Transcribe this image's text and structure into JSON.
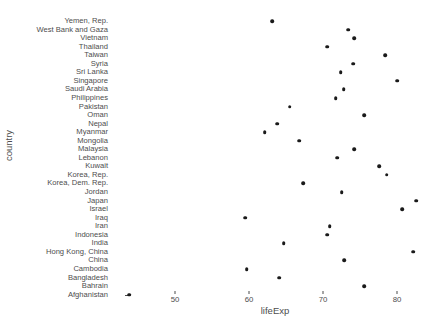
{
  "chart_data": {
    "type": "scatter",
    "title": "",
    "xlabel": "lifeExp",
    "ylabel": "country",
    "xlim": [
      42,
      86
    ],
    "xticks": [
      50,
      60,
      70,
      80
    ],
    "xticklabels": [
      "50",
      "60",
      "70",
      "80"
    ],
    "grid": false,
    "legend": null,
    "categories": [
      "Afghanistan",
      "Bahrain",
      "Bangladesh",
      "Cambodia",
      "China",
      "Hong Kong, China",
      "India",
      "Indonesia",
      "Iran",
      "Iraq",
      "Israel",
      "Japan",
      "Jordan",
      "Korea, Dem. Rep.",
      "Korea, Rep.",
      "Kuwait",
      "Lebanon",
      "Malaysia",
      "Mongolia",
      "Myanmar",
      "Nepal",
      "Oman",
      "Pakistan",
      "Philippines",
      "Saudi Arabia",
      "Singapore",
      "Sri Lanka",
      "Syria",
      "Taiwan",
      "Thailand",
      "Vietnam",
      "West Bank and Gaza",
      "Yemen, Rep."
    ],
    "points": [
      {
        "country": "Yemen, Rep.",
        "lifeExp": 63.1
      },
      {
        "country": "West Bank and Gaza",
        "lifeExp": 73.4
      },
      {
        "country": "Vietnam",
        "lifeExp": 74.2
      },
      {
        "country": "Thailand",
        "lifeExp": 70.6
      },
      {
        "country": "Taiwan",
        "lifeExp": 78.4
      },
      {
        "country": "Syria",
        "lifeExp": 74.1
      },
      {
        "country": "Sri Lanka",
        "lifeExp": 72.4
      },
      {
        "country": "Singapore",
        "lifeExp": 80.0
      },
      {
        "country": "Saudi Arabia",
        "lifeExp": 72.8
      },
      {
        "country": "Philippines",
        "lifeExp": 71.7
      },
      {
        "country": "Pakistan",
        "lifeExp": 65.5
      },
      {
        "country": "Oman",
        "lifeExp": 75.6
      },
      {
        "country": "Nepal",
        "lifeExp": 63.8
      },
      {
        "country": "Myanmar",
        "lifeExp": 62.1
      },
      {
        "country": "Mongolia",
        "lifeExp": 66.8
      },
      {
        "country": "Malaysia",
        "lifeExp": 74.2
      },
      {
        "country": "Lebanon",
        "lifeExp": 71.9
      },
      {
        "country": "Kuwait",
        "lifeExp": 77.6
      },
      {
        "country": "Korea, Rep.",
        "lifeExp": 78.6
      },
      {
        "country": "Korea, Dem. Rep.",
        "lifeExp": 67.3
      },
      {
        "country": "Jordan",
        "lifeExp": 72.5
      },
      {
        "country": "Japan",
        "lifeExp": 82.6
      },
      {
        "country": "Israel",
        "lifeExp": 80.7
      },
      {
        "country": "Iraq",
        "lifeExp": 59.5
      },
      {
        "country": "Iran",
        "lifeExp": 70.9
      },
      {
        "country": "Indonesia",
        "lifeExp": 70.6
      },
      {
        "country": "India",
        "lifeExp": 64.7
      },
      {
        "country": "Hong Kong, China",
        "lifeExp": 82.2
      },
      {
        "country": "China",
        "lifeExp": 72.9
      },
      {
        "country": "Cambodia",
        "lifeExp": 59.7
      },
      {
        "country": "Bangladesh",
        "lifeExp": 64.1
      },
      {
        "country": "Bahrain",
        "lifeExp": 75.6
      },
      {
        "country": "Afghanistan",
        "lifeExp": 43.8
      }
    ]
  },
  "axes": {
    "y_title": "country",
    "x_title": "lifeExp"
  }
}
